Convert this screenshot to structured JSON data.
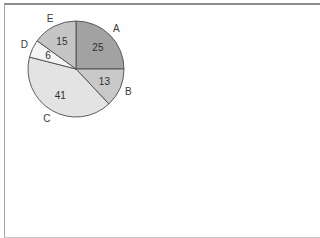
{
  "figure": {
    "background": "#fefefe",
    "frame_border_color": "#8c8c8c"
  },
  "chart_data": {
    "type": "pie",
    "title": "",
    "total": 100,
    "start_angle_deg": 0,
    "direction": "clockwise",
    "stroke_color": "#4d4d4d",
    "legend_position": "none",
    "category_labels_outside": true,
    "value_labels_inside": true,
    "slices": [
      {
        "label": "A",
        "value": 25,
        "color": "#a2a2a2"
      },
      {
        "label": "B",
        "value": 13,
        "color": "#c9c9c9"
      },
      {
        "label": "C",
        "value": 41,
        "color": "#e3e3e3"
      },
      {
        "label": "D",
        "value": 6,
        "color": "#f4f4f4"
      },
      {
        "label": "E",
        "value": 15,
        "color": "#c5c5c5"
      }
    ]
  }
}
